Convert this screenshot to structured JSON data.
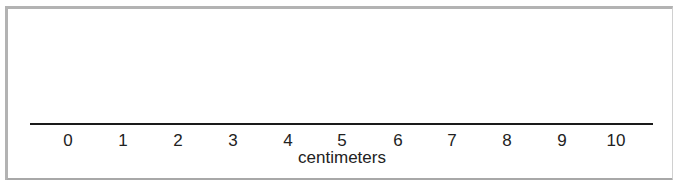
{
  "ruler": {
    "unit": "centimeters",
    "ticks": [
      {
        "label": "0",
        "x": 68
      },
      {
        "label": "1",
        "x": 123
      },
      {
        "label": "2",
        "x": 178
      },
      {
        "label": "3",
        "x": 233
      },
      {
        "label": "4",
        "x": 288
      },
      {
        "label": "5",
        "x": 342
      },
      {
        "label": "6",
        "x": 398
      },
      {
        "label": "7",
        "x": 452
      },
      {
        "label": "8",
        "x": 507
      },
      {
        "label": "9",
        "x": 562
      },
      {
        "label": "10",
        "x": 616
      }
    ]
  },
  "colors": {
    "frame": "#b3b3b3",
    "line": "#1a1a1a",
    "text": "#222222"
  }
}
